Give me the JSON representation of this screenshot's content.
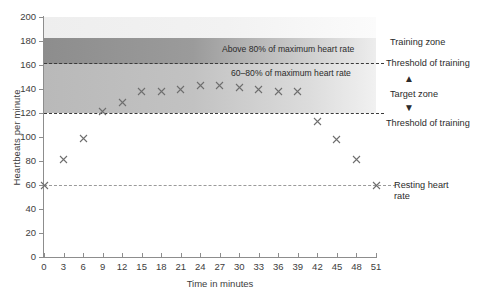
{
  "chart_data": {
    "type": "scatter",
    "title": "",
    "xlabel": "Time in minutes",
    "ylabel": "Heartbeats per minute",
    "xlim": [
      0,
      51
    ],
    "ylim": [
      0,
      200
    ],
    "xticks": [
      0,
      3,
      6,
      9,
      12,
      15,
      18,
      21,
      24,
      27,
      30,
      33,
      36,
      39,
      42,
      45,
      48,
      51
    ],
    "yticks": [
      0,
      20,
      40,
      60,
      80,
      100,
      120,
      140,
      160,
      180,
      200
    ],
    "grid": false,
    "legend": "none",
    "marker": "x",
    "marker_color": "#6e6e6e",
    "x": [
      0,
      3,
      6,
      9,
      12,
      15,
      18,
      21,
      24,
      27,
      30,
      33,
      36,
      39,
      42,
      45,
      48,
      51
    ],
    "values": [
      60,
      81,
      99,
      121,
      129,
      138,
      138,
      140,
      143,
      143,
      141,
      140,
      138,
      138,
      113,
      98,
      81,
      60
    ],
    "series": [
      {
        "name": "Heart rate",
        "values": [
          60,
          81,
          99,
          121,
          129,
          138,
          138,
          140,
          143,
          143,
          141,
          140,
          138,
          138,
          113,
          98,
          81,
          60
        ]
      }
    ],
    "bands": [
      {
        "name": "above-80-percent",
        "label": "Above 80% of maximum heart rate",
        "y_from": 163,
        "y_to": 185,
        "color": "#909090"
      },
      {
        "name": "target-zone",
        "label": "60–80% of maximum heart rate",
        "y_from": 122,
        "y_to": 163,
        "color": "#c0c0c0"
      }
    ],
    "reference_lines": [
      {
        "name": "upper-threshold-of-training",
        "y": 163,
        "label": "Threshold of training",
        "style": "dashed"
      },
      {
        "name": "lower-threshold-of-training",
        "y": 122,
        "label": "Threshold of training",
        "style": "dashed"
      },
      {
        "name": "resting-heart-rate",
        "y": 60,
        "label": "Resting heart rate",
        "style": "dashed"
      }
    ],
    "annotations": [
      {
        "name": "training-zone",
        "text": "Training zone",
        "y": 172
      },
      {
        "name": "target-zone",
        "text": "Target zone",
        "y": 142
      },
      {
        "name": "resting-heart-rate",
        "text": "Resting heart rate",
        "y": 60
      }
    ]
  },
  "axis": {
    "ylabel": "Heartbeats per minute",
    "xlabel": "Time in minutes"
  },
  "zone_labels": {
    "above80": "Above 80% of maximum heart rate",
    "target_pct": "60–80% of maximum heart rate"
  },
  "right_labels": {
    "training_zone": "Training zone",
    "threshold_upper": "Threshold of training",
    "target_zone": "Target zone",
    "threshold_lower": "Threshold of training",
    "resting_line1": "Resting heart",
    "resting_line2": "rate",
    "arrow_up": "▲",
    "arrow_down": "▼"
  }
}
